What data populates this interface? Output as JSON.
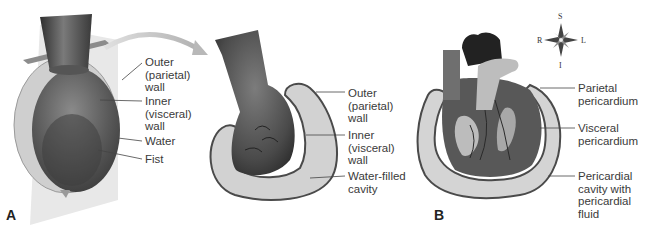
{
  "figure": {
    "panels": [
      {
        "id": "A",
        "letter": "A",
        "labels": [
          {
            "text": "Outer\n(parietal)\nwall"
          },
          {
            "text": "Inner\n(visceral)\nwall"
          },
          {
            "text": "Water"
          },
          {
            "text": "Fist"
          }
        ]
      },
      {
        "id": "A-cutaway",
        "labels": [
          {
            "text": "Outer\n(parietal)\nwall"
          },
          {
            "text": "Inner\n(visceral)\nwall"
          },
          {
            "text": "Water-filled\ncavity"
          }
        ]
      },
      {
        "id": "B",
        "letter": "B",
        "labels": [
          {
            "text": "Parietal\npericardium"
          },
          {
            "text": "Visceral\npericardium"
          },
          {
            "text": "Pericardial\ncavity with\npericardial\nfluid"
          }
        ]
      }
    ],
    "compass": {
      "top": "S",
      "bottom": "I",
      "left": "R",
      "right": "L"
    },
    "colors": {
      "dark": "#3a3a3a",
      "mid": "#6e6e6e",
      "light": "#c9c9c9",
      "sac": "#d4d4d4",
      "sac_outline": "#4a4a4a",
      "plane": "#e6e6e6"
    }
  }
}
